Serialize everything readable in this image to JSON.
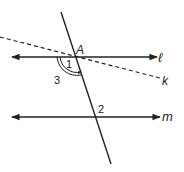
{
  "diagram": {
    "type": "geometry-parallel-lines-transversal",
    "colors": {
      "stroke": "#222222",
      "background": "#ffffff"
    },
    "lines": {
      "l": {
        "label": "ℓ",
        "style": "solid",
        "arrows": "both"
      },
      "m": {
        "label": "m",
        "style": "solid",
        "arrows": "both"
      },
      "k": {
        "label": "k",
        "style": "dashed",
        "arrows": "none"
      },
      "transversal": {
        "style": "solid",
        "arrows": "none"
      }
    },
    "points": {
      "A": {
        "label": "A"
      }
    },
    "angles": {
      "angle1": {
        "label": "1"
      },
      "angle2": {
        "label": "2"
      },
      "angle3": {
        "label": "3",
        "marker": "double-arc-with-arrow"
      }
    }
  }
}
